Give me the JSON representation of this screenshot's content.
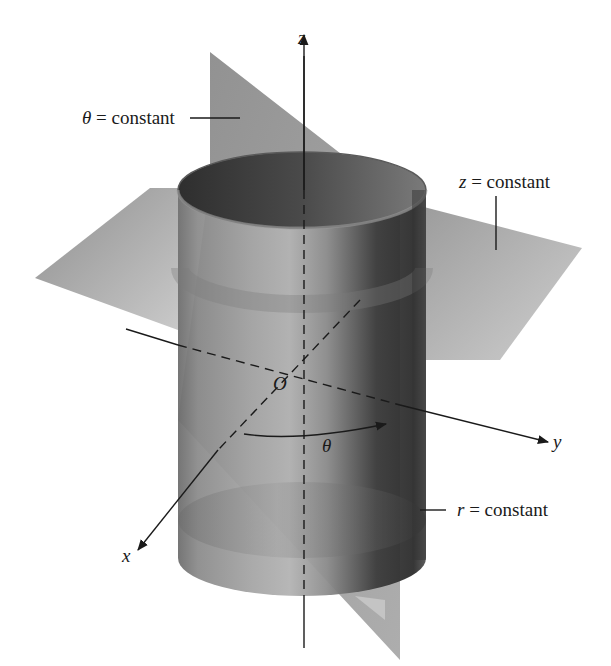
{
  "figure": {
    "labels": {
      "theta_plane": "θ = constant",
      "z_plane": "z = constant",
      "r_cylinder": "r = constant",
      "axis_z": "z",
      "axis_y": "y",
      "axis_x": "x",
      "origin": "O",
      "angle": "θ"
    },
    "label_parts": {
      "theta_sym": "θ",
      "z_sym": "z",
      "r_sym": "r",
      "eq_text": " = constant"
    },
    "colors": {
      "background": "#ffffff",
      "plane_gray": "#9a9a9a",
      "cylinder_dark": "#3a3a3a",
      "cylinder_light": "#b8b8b8",
      "ink": "#1a1a1a"
    }
  }
}
